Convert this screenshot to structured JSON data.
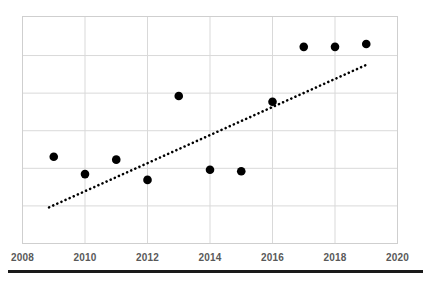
{
  "chart_data": {
    "type": "scatter",
    "title": "",
    "subtitle": "",
    "xlabel": "",
    "ylabel": "",
    "x": [
      2009,
      2010,
      2011,
      2012,
      2013,
      2014,
      2015,
      2016,
      2017,
      2018,
      2019
    ],
    "values": [
      3.0,
      2.4,
      2.9,
      2.2,
      5.1,
      2.55,
      2.5,
      4.9,
      6.8,
      6.8,
      6.9
    ],
    "series": [
      {
        "name": "data-points",
        "marker": "circle",
        "color": "#000000",
        "points": [
          {
            "x": 2009,
            "y": 3.0
          },
          {
            "x": 2010,
            "y": 2.4
          },
          {
            "x": 2011,
            "y": 2.9
          },
          {
            "x": 2012,
            "y": 2.2
          },
          {
            "x": 2013,
            "y": 5.1
          },
          {
            "x": 2014,
            "y": 2.55
          },
          {
            "x": 2015,
            "y": 2.5
          },
          {
            "x": 2016,
            "y": 4.9
          },
          {
            "x": 2017,
            "y": 6.8
          },
          {
            "x": 2018,
            "y": 6.8
          },
          {
            "x": 2019,
            "y": 6.9
          }
        ]
      }
    ],
    "trendline": {
      "name": "linear-trendline",
      "style": "dotted",
      "color": "#000000",
      "x_start": 2008.85,
      "y_start": 1.25,
      "x_end": 2019.05,
      "y_end": 6.2
    },
    "xlim": [
      2008,
      2020
    ],
    "ylim": [
      0,
      7.85
    ],
    "xticks": [
      2008,
      2010,
      2012,
      2014,
      2016,
      2018,
      2020
    ],
    "xticklabels": [
      "2008",
      "2010",
      "2012",
      "2014",
      "2016",
      "2018",
      "2020"
    ],
    "yticks": [
      0,
      1.3,
      2.6,
      3.9,
      5.2,
      6.5,
      7.85
    ],
    "yticklabels": [
      "",
      "",
      "",
      "",
      "",
      "",
      ""
    ],
    "grid": {
      "horizontal": true,
      "vertical": true,
      "color": "#d9d9d9"
    },
    "legend": {
      "visible": false,
      "position": "none"
    },
    "plot_border": {
      "visible": true,
      "color": "#d0d0d0"
    }
  },
  "colors": {
    "marker": "#000000",
    "trendline": "#000000",
    "grid": "#d9d9d9",
    "border": "#cfcfcf",
    "tick_label": "#595959",
    "background": "#ffffff",
    "footer_rule": "#1a1a1a"
  },
  "footer": {
    "rule_label": "bottom-rule"
  }
}
